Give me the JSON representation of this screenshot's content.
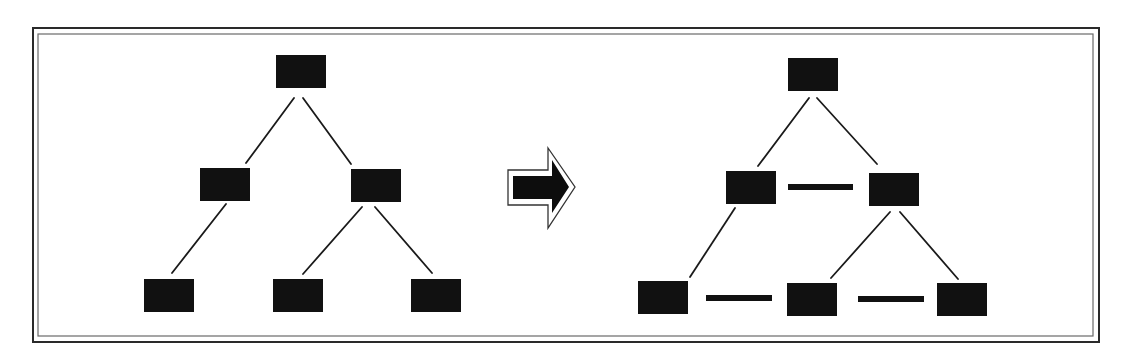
{
  "diagram": {
    "type": "tree-transformation",
    "colors": {
      "node": "#111111",
      "edge": "#1a1a1a",
      "frame_outer": "#2a2a2a",
      "frame_inner": "#6a6a6a",
      "background": "#ffffff"
    },
    "frame": {
      "outer": {
        "x": 33,
        "y": 28,
        "w": 1066,
        "h": 314
      },
      "inner": {
        "x": 38,
        "y": 34,
        "w": 1055,
        "h": 302
      }
    },
    "node_size": {
      "w": 50,
      "h": 33
    },
    "left_tree": {
      "nodes": [
        {
          "id": "root",
          "x": 276,
          "y": 55
        },
        {
          "id": "left-child",
          "x": 200,
          "y": 168
        },
        {
          "id": "right-child",
          "x": 351,
          "y": 169
        },
        {
          "id": "leaf-1",
          "x": 144,
          "y": 279
        },
        {
          "id": "leaf-2",
          "x": 273,
          "y": 279
        },
        {
          "id": "leaf-3",
          "x": 411,
          "y": 279
        }
      ],
      "edges": [
        {
          "from": "root",
          "to": "left-child",
          "x1": 294,
          "y1": 98,
          "x2": 246,
          "y2": 163
        },
        {
          "from": "root",
          "to": "right-child",
          "x1": 303,
          "y1": 98,
          "x2": 351,
          "y2": 164
        },
        {
          "from": "left-child",
          "to": "leaf-1",
          "x1": 226,
          "y1": 204,
          "x2": 172,
          "y2": 273
        },
        {
          "from": "right-child",
          "to": "leaf-2",
          "x1": 362,
          "y1": 207,
          "x2": 303,
          "y2": 274
        },
        {
          "from": "right-child",
          "to": "leaf-3",
          "x1": 375,
          "y1": 207,
          "x2": 432,
          "y2": 273
        }
      ]
    },
    "arrow": {
      "direction": "right",
      "outline_points": "508,170 548,170 548,148 575,187 548,228 548,205 508,205",
      "fill_points": "513,176 552,176 552,160 569,187 552,213 552,199 513,199"
    },
    "right_tree": {
      "nodes": [
        {
          "id": "root",
          "x": 788,
          "y": 58
        },
        {
          "id": "left-child",
          "x": 726,
          "y": 171
        },
        {
          "id": "right-child",
          "x": 869,
          "y": 173
        },
        {
          "id": "leaf-1",
          "x": 638,
          "y": 281
        },
        {
          "id": "leaf-2",
          "x": 787,
          "y": 283
        },
        {
          "id": "leaf-3",
          "x": 937,
          "y": 283
        }
      ],
      "edges": [
        {
          "from": "root",
          "to": "left-child",
          "x1": 809,
          "y1": 98,
          "x2": 758,
          "y2": 166
        },
        {
          "from": "root",
          "to": "right-child",
          "x1": 817,
          "y1": 98,
          "x2": 877,
          "y2": 164
        },
        {
          "from": "left-child",
          "to": "leaf-1",
          "x1": 735,
          "y1": 208,
          "x2": 690,
          "y2": 277
        },
        {
          "from": "right-child",
          "to": "leaf-2",
          "x1": 890,
          "y1": 212,
          "x2": 831,
          "y2": 278
        },
        {
          "from": "right-child",
          "to": "leaf-3",
          "x1": 900,
          "y1": 212,
          "x2": 958,
          "y2": 279
        }
      ],
      "sibling_links": [
        {
          "from": "left-child",
          "to": "right-child",
          "x": 788,
          "y": 184,
          "w": 65,
          "h": 6
        },
        {
          "from": "leaf-1",
          "to": "leaf-2",
          "x": 706,
          "y": 295,
          "w": 66,
          "h": 6
        },
        {
          "from": "leaf-2",
          "to": "leaf-3",
          "x": 858,
          "y": 296,
          "w": 66,
          "h": 6
        }
      ]
    }
  }
}
